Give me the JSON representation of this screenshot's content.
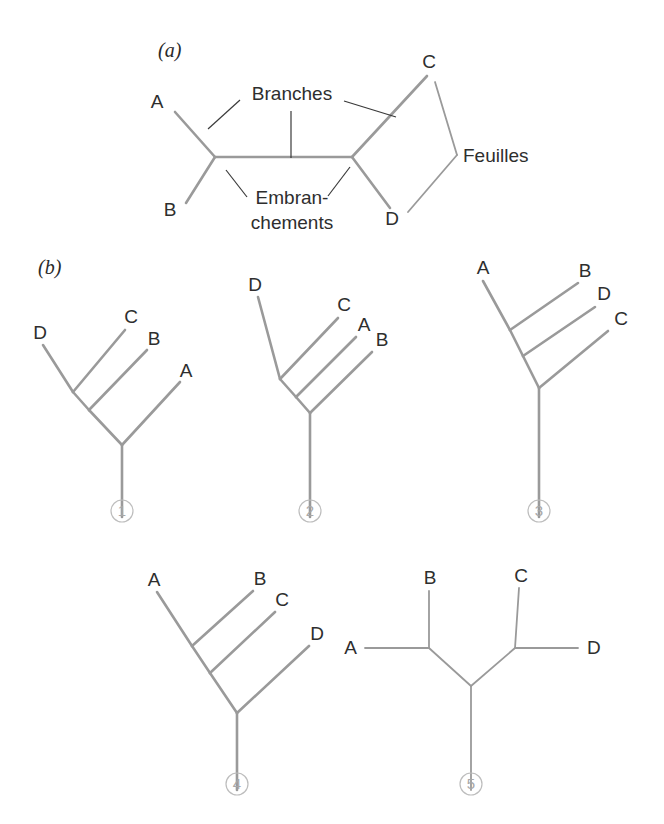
{
  "figure": {
    "background_color": "#ffffff",
    "branch_color": "#9a9a9a",
    "leader_color": "#3a3a3a",
    "text_color": "#2e2e2e",
    "number_color": "#a8a8a8"
  },
  "panel_a": {
    "label": "(a)",
    "annotations": [
      {
        "key": "branches",
        "text": "Branches"
      },
      {
        "key": "embranchements_line1",
        "text": "Embran-"
      },
      {
        "key": "embranchements_line2",
        "text": "chements"
      },
      {
        "key": "feuilles",
        "text": "Feuilles"
      }
    ],
    "taxa": [
      {
        "key": "a",
        "text": "A"
      },
      {
        "key": "b",
        "text": "B"
      },
      {
        "key": "c",
        "text": "C"
      },
      {
        "key": "d",
        "text": "D"
      }
    ]
  },
  "panel_b": {
    "label": "(b)",
    "trees": [
      {
        "number": "1",
        "taxa": [
          {
            "key": "d",
            "text": "D"
          },
          {
            "key": "c",
            "text": "C"
          },
          {
            "key": "b",
            "text": "B"
          },
          {
            "key": "a",
            "text": "A"
          }
        ]
      },
      {
        "number": "2",
        "taxa": [
          {
            "key": "d",
            "text": "D"
          },
          {
            "key": "c",
            "text": "C"
          },
          {
            "key": "a",
            "text": "A"
          },
          {
            "key": "b",
            "text": "B"
          }
        ]
      },
      {
        "number": "3",
        "taxa": [
          {
            "key": "a",
            "text": "A"
          },
          {
            "key": "b",
            "text": "B"
          },
          {
            "key": "d",
            "text": "D"
          },
          {
            "key": "c",
            "text": "C"
          }
        ]
      },
      {
        "number": "4",
        "taxa": [
          {
            "key": "a",
            "text": "A"
          },
          {
            "key": "b",
            "text": "B"
          },
          {
            "key": "c",
            "text": "C"
          },
          {
            "key": "d",
            "text": "D"
          }
        ]
      },
      {
        "number": "5",
        "taxa": [
          {
            "key": "b",
            "text": "B"
          },
          {
            "key": "c",
            "text": "C"
          },
          {
            "key": "a",
            "text": "A"
          },
          {
            "key": "d",
            "text": "D"
          }
        ]
      }
    ]
  }
}
